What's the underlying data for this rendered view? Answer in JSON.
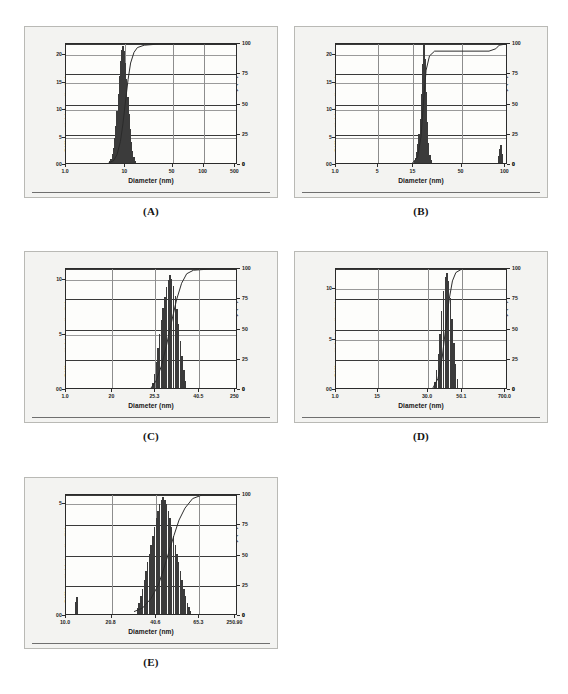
{
  "figure": {
    "panels": [
      {
        "caption": "(A)",
        "axis_left_label": "Differential Intensity (%)",
        "axis_right_label": "Cumulative Intensity (%)",
        "axis_x_label": "Diameter (nm)",
        "yticks_left": [
          "0",
          "5",
          "10",
          "15",
          "20"
        ],
        "yticks_right": [
          "0",
          "25",
          "50",
          "75",
          "100"
        ],
        "xticks": [
          "1.0",
          "10",
          "50",
          "100",
          "500"
        ]
      },
      {
        "caption": "(B)",
        "axis_left_label": "Differential Intensity (%)",
        "axis_right_label": "Cumulative Intensity (%)",
        "axis_x_label": "Diameter (nm)",
        "yticks_left": [
          "0",
          "5",
          "10",
          "15",
          "20"
        ],
        "yticks_right": [
          "0",
          "25",
          "50",
          "75",
          "100"
        ],
        "xticks": [
          "1.0",
          "5",
          "15",
          "50",
          "100"
        ]
      },
      {
        "caption": "(C)",
        "axis_left_label": "Differential Intensity (%)",
        "axis_right_label": "Cumulative Intensity (%)",
        "axis_x_label": "Diameter (nm)",
        "yticks_left": [
          "0",
          "5",
          "10"
        ],
        "yticks_right": [
          "0",
          "25",
          "50",
          "75",
          "100"
        ],
        "xticks": [
          "1.0",
          "20",
          "25.3",
          "40.5",
          "250"
        ]
      },
      {
        "caption": "(D)",
        "axis_left_label": "Differential Intensity (%)",
        "axis_right_label": "Cumulative Intensity (%)",
        "axis_x_label": "Diameter (nm)",
        "yticks_left": [
          "0",
          "5",
          "10"
        ],
        "yticks_right": [
          "0",
          "25",
          "50",
          "75",
          "100"
        ],
        "xticks": [
          "1.0",
          "15",
          "30.0",
          "50.1",
          "700.0"
        ]
      },
      {
        "caption": "(E)",
        "axis_left_label": "Differential Intensity (%)",
        "axis_right_label": "Cumulative Intensity (%)",
        "axis_x_label": "Diameter (nm)",
        "yticks_left": [
          "0",
          "5"
        ],
        "yticks_right": [
          "0",
          "25",
          "50",
          "75",
          "100"
        ],
        "xticks": [
          "10.0",
          "20.8",
          "40.6",
          "65.3",
          "250.90"
        ]
      }
    ]
  },
  "chart_data": [
    {
      "type": "bar",
      "panel": "A",
      "title": "Particle size distribution (A)",
      "xlabel": "Diameter (nm)",
      "ylabel": "Differential Intensity (%)",
      "ylabel_secondary": "Cumulative Intensity (%)",
      "xscale": "log",
      "xtick_labels": [
        "1.0",
        "10",
        "50",
        "100",
        "500"
      ],
      "xtick_positions": [
        0.0,
        0.345,
        0.62,
        0.8,
        0.985
      ],
      "ylim": [
        0,
        22
      ],
      "ytick_labels": [
        "0",
        "5",
        "10",
        "15",
        "20"
      ],
      "ylim_secondary": [
        0,
        100
      ],
      "ytick_labels_secondary": [
        "0",
        "25",
        "50",
        "75",
        "100"
      ],
      "grid": true,
      "legend": "none",
      "bar_positions": [
        0.255,
        0.262,
        0.269,
        0.276,
        0.283,
        0.29,
        0.297,
        0.304,
        0.311,
        0.318,
        0.325,
        0.332,
        0.339,
        0.346,
        0.353,
        0.36,
        0.367,
        0.374,
        0.381,
        0.388,
        0.395,
        0.402
      ],
      "values": [
        0.3,
        0.8,
        1.6,
        2.8,
        4.5,
        6.8,
        9.5,
        12.6,
        15.8,
        18.6,
        20.6,
        21.3,
        20.4,
        18.2,
        15.2,
        12.0,
        8.9,
        6.1,
        3.9,
        2.2,
        1.1,
        0.4
      ],
      "cumulative_x": [
        0.25,
        0.28,
        0.3,
        0.32,
        0.335,
        0.35,
        0.365,
        0.38,
        0.4,
        0.42,
        0.46,
        0.55,
        0.75,
        1.0
      ],
      "cumulative_values": [
        0,
        2,
        7,
        18,
        33,
        52,
        70,
        84,
        93,
        97,
        99,
        100,
        100,
        100
      ]
    },
    {
      "type": "bar",
      "panel": "B",
      "title": "Particle size distribution (B)",
      "xlabel": "Diameter (nm)",
      "ylabel": "Differential Intensity (%)",
      "ylabel_secondary": "Cumulative Intensity (%)",
      "xscale": "log",
      "xtick_labels": [
        "1.0",
        "5",
        "15",
        "50",
        "100"
      ],
      "xtick_positions": [
        0.0,
        0.245,
        0.45,
        0.73,
        0.985
      ],
      "ylim": [
        0,
        22
      ],
      "ytick_labels": [
        "0",
        "5",
        "10",
        "15",
        "20"
      ],
      "ylim_secondary": [
        0,
        100
      ],
      "ytick_labels_secondary": [
        "0",
        "25",
        "50",
        "75",
        "100"
      ],
      "grid": true,
      "legend": "none",
      "bar_positions": [
        0.455,
        0.462,
        0.469,
        0.476,
        0.483,
        0.49,
        0.497,
        0.504,
        0.511,
        0.518,
        0.525,
        0.532,
        0.539,
        0.546,
        0.553
      ],
      "values": [
        0.4,
        1.0,
        2.0,
        3.4,
        5.2,
        8.0,
        12.5,
        18.0,
        21.5,
        19.0,
        13.0,
        7.5,
        3.6,
        1.4,
        0.5
      ],
      "secondary_peak_positions": [
        0.945,
        0.952,
        0.959,
        0.966
      ],
      "secondary_peak_values": [
        1.2,
        2.6,
        3.2,
        1.6
      ],
      "cumulative_x": [
        0.45,
        0.48,
        0.5,
        0.515,
        0.53,
        0.55,
        0.58,
        0.7,
        0.9,
        0.94,
        0.96,
        1.0
      ],
      "cumulative_values": [
        0,
        5,
        22,
        52,
        78,
        90,
        94,
        94,
        94,
        96,
        99,
        100
      ]
    },
    {
      "type": "bar",
      "panel": "C",
      "title": "Particle size distribution (C)",
      "xlabel": "Diameter (nm)",
      "ylabel": "Differential Intensity (%)",
      "ylabel_secondary": "Cumulative Intensity (%)",
      "xscale": "log",
      "xtick_labels": [
        "1.0",
        "20",
        "25.3",
        "40.5",
        "250"
      ],
      "xtick_positions": [
        0.0,
        0.27,
        0.52,
        0.775,
        0.985
      ],
      "ylim": [
        0,
        11
      ],
      "ytick_labels": [
        "0",
        "5",
        "10"
      ],
      "ylim_secondary": [
        0,
        100
      ],
      "ytick_labels_secondary": [
        "0",
        "25",
        "50",
        "75",
        "100"
      ],
      "grid": true,
      "legend": "none",
      "bar_positions": [
        0.505,
        0.515,
        0.525,
        0.535,
        0.545,
        0.555,
        0.565,
        0.575,
        0.585,
        0.595,
        0.605,
        0.615,
        0.625,
        0.635,
        0.645,
        0.655,
        0.665,
        0.675,
        0.685,
        0.695
      ],
      "values": [
        0.5,
        1.3,
        2.4,
        3.6,
        4.9,
        6.2,
        7.3,
        8.3,
        9.2,
        9.8,
        10.3,
        9.9,
        9.3,
        8.4,
        7.2,
        5.8,
        4.3,
        2.9,
        1.6,
        0.6
      ],
      "cumulative_x": [
        0.5,
        0.53,
        0.56,
        0.59,
        0.62,
        0.65,
        0.68,
        0.71,
        0.75,
        0.85,
        1.0
      ],
      "cumulative_values": [
        0,
        6,
        18,
        35,
        55,
        74,
        88,
        96,
        99,
        100,
        100
      ]
    },
    {
      "type": "bar",
      "panel": "D",
      "title": "Particle size distribution (D)",
      "xlabel": "Diameter (nm)",
      "ylabel": "Differential Intensity (%)",
      "ylabel_secondary": "Cumulative Intensity (%)",
      "xscale": "log",
      "xtick_labels": [
        "1.0",
        "15",
        "30.0",
        "50.1",
        "700.0"
      ],
      "xtick_positions": [
        0.0,
        0.245,
        0.535,
        0.735,
        0.985
      ],
      "ylim": [
        0,
        12
      ],
      "ytick_labels": [
        "0",
        "5",
        "10"
      ],
      "ylim_secondary": [
        0,
        100
      ],
      "ytick_labels_secondary": [
        "0",
        "25",
        "50",
        "75",
        "100"
      ],
      "grid": true,
      "legend": "none",
      "bar_positions": [
        0.575,
        0.585,
        0.595,
        0.605,
        0.615,
        0.625,
        0.635,
        0.645,
        0.655,
        0.665,
        0.675,
        0.685,
        0.695,
        0.705
      ],
      "values": [
        0.6,
        1.8,
        3.4,
        5.4,
        7.6,
        9.6,
        11.0,
        11.4,
        10.6,
        8.9,
        6.8,
        4.5,
        2.4,
        0.9
      ],
      "cumulative_x": [
        0.57,
        0.6,
        0.625,
        0.645,
        0.665,
        0.685,
        0.705,
        0.74,
        0.8,
        1.0
      ],
      "cumulative_values": [
        0,
        8,
        26,
        50,
        74,
        90,
        97,
        100,
        100,
        100
      ]
    },
    {
      "type": "bar",
      "panel": "E",
      "title": "Particle size distribution (E)",
      "xlabel": "Diameter (nm)",
      "ylabel": "Differential Intensity (%)",
      "ylabel_secondary": "Cumulative Intensity (%)",
      "xscale": "log",
      "xtick_labels": [
        "10.0",
        "20.8",
        "40.6",
        "65.3",
        "250.90"
      ],
      "xtick_positions": [
        0.0,
        0.265,
        0.525,
        0.775,
        0.985
      ],
      "ylim": [
        0,
        5.4
      ],
      "ytick_labels": [
        "0",
        "5"
      ],
      "ylim_secondary": [
        0,
        100
      ],
      "ytick_labels_secondary": [
        "0",
        "25",
        "50",
        "75",
        "100"
      ],
      "grid": true,
      "legend": "none",
      "bar_positions": [
        0.415,
        0.425,
        0.435,
        0.445,
        0.455,
        0.465,
        0.475,
        0.485,
        0.495,
        0.505,
        0.515,
        0.525,
        0.535,
        0.545,
        0.555,
        0.565,
        0.575,
        0.585,
        0.595,
        0.605,
        0.615,
        0.625,
        0.635,
        0.645,
        0.655,
        0.665,
        0.675,
        0.685,
        0.695,
        0.705,
        0.715,
        0.725
      ],
      "values": [
        0.25,
        0.5,
        0.8,
        1.1,
        1.5,
        1.9,
        2.3,
        2.7,
        3.1,
        3.5,
        3.9,
        4.3,
        4.6,
        4.9,
        5.1,
        5.2,
        5.1,
        4.9,
        4.6,
        4.3,
        3.9,
        3.5,
        3.1,
        2.7,
        2.3,
        1.9,
        1.5,
        1.1,
        0.8,
        0.5,
        0.3,
        0.15
      ],
      "secondary_peak_positions": [
        0.055,
        0.065
      ],
      "secondary_peak_values": [
        0.55,
        0.75
      ],
      "cumulative_x": [
        0.4,
        0.45,
        0.5,
        0.545,
        0.575,
        0.605,
        0.635,
        0.665,
        0.7,
        0.745,
        0.8,
        1.0
      ],
      "cumulative_values": [
        2,
        5,
        13,
        25,
        38,
        52,
        66,
        79,
        89,
        97,
        100,
        100
      ]
    }
  ]
}
